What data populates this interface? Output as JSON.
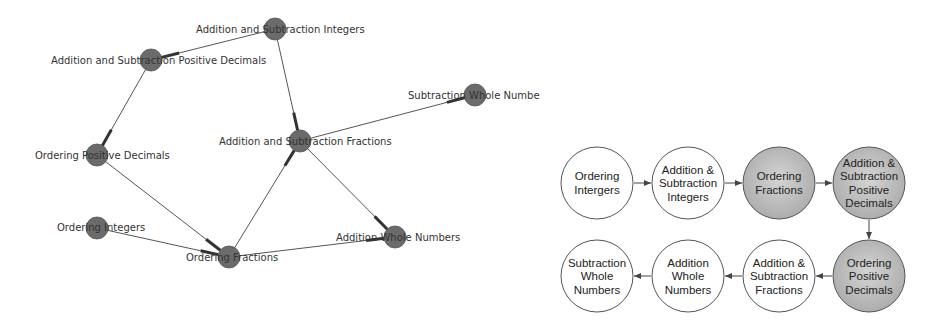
{
  "graph": {
    "title": "Prerequisite network graph",
    "node_color": "#6b6b6b",
    "edge_color": "#555555",
    "nodes": [
      {
        "id": "asi",
        "label": "Addition and Subtraction Integers",
        "x": 275,
        "y": 29,
        "lx": 196,
        "ly": 33
      },
      {
        "id": "aspd",
        "label": "Addition and Subtraction Positive Decimals",
        "x": 151,
        "y": 60,
        "lx": 51,
        "ly": 64
      },
      {
        "id": "opd",
        "label": "Ordering Positive Decimals",
        "x": 97,
        "y": 155,
        "lx": 35,
        "ly": 159
      },
      {
        "id": "asf",
        "label": "Addition and Subtraction Fractions",
        "x": 300,
        "y": 141,
        "lx": 219,
        "ly": 145
      },
      {
        "id": "swn",
        "label": "Subtraction Whole Numbers",
        "x": 475,
        "y": 95,
        "lx": 408,
        "ly": 99
      },
      {
        "id": "oi",
        "label": "Ordering Integers",
        "x": 97,
        "y": 228,
        "lx": 57,
        "ly": 231
      },
      {
        "id": "of",
        "label": "Ordering Fractions",
        "x": 229,
        "y": 257,
        "lx": 186,
        "ly": 261
      },
      {
        "id": "awn",
        "label": "Addition Whole Numbers",
        "x": 395,
        "y": 237,
        "lx": 336,
        "ly": 241
      }
    ],
    "edges": [
      {
        "from": "asi",
        "to": "aspd"
      },
      {
        "from": "asi",
        "to": "asf"
      },
      {
        "from": "aspd",
        "to": "opd"
      },
      {
        "from": "asf",
        "to": "swn"
      },
      {
        "from": "asf",
        "to": "awn"
      },
      {
        "from": "opd",
        "to": "of"
      },
      {
        "from": "oi",
        "to": "of"
      },
      {
        "from": "of",
        "to": "asf"
      },
      {
        "from": "of",
        "to": "awn"
      }
    ]
  },
  "flow": {
    "title": "Learning sequence",
    "radius": 36,
    "shaded_fill": "#bdbdbd",
    "plain_fill": "#ffffff",
    "steps": [
      {
        "lines": [
          "Ordering",
          "Intergers"
        ],
        "x": 597,
        "y": 183,
        "shaded": false
      },
      {
        "lines": [
          "Addition &",
          "Subtraction",
          "Integers"
        ],
        "x": 688,
        "y": 183,
        "shaded": false
      },
      {
        "lines": [
          "Ordering",
          "Fractions"
        ],
        "x": 779,
        "y": 183,
        "shaded": true
      },
      {
        "lines": [
          "Addition &",
          "Subtraction",
          "Positive",
          "Decimals"
        ],
        "x": 869,
        "y": 183,
        "shaded": true
      },
      {
        "lines": [
          "Ordering",
          "Positive",
          "Decimals"
        ],
        "x": 869,
        "y": 276,
        "shaded": true
      },
      {
        "lines": [
          "Addition &",
          "Subtraction",
          "Fractions"
        ],
        "x": 779,
        "y": 276,
        "shaded": false
      },
      {
        "lines": [
          "Addition",
          "Whole",
          "Numbers"
        ],
        "x": 688,
        "y": 276,
        "shaded": false
      },
      {
        "lines": [
          "Subtraction",
          "Whole",
          "Numbers"
        ],
        "x": 597,
        "y": 276,
        "shaded": false
      }
    ]
  }
}
